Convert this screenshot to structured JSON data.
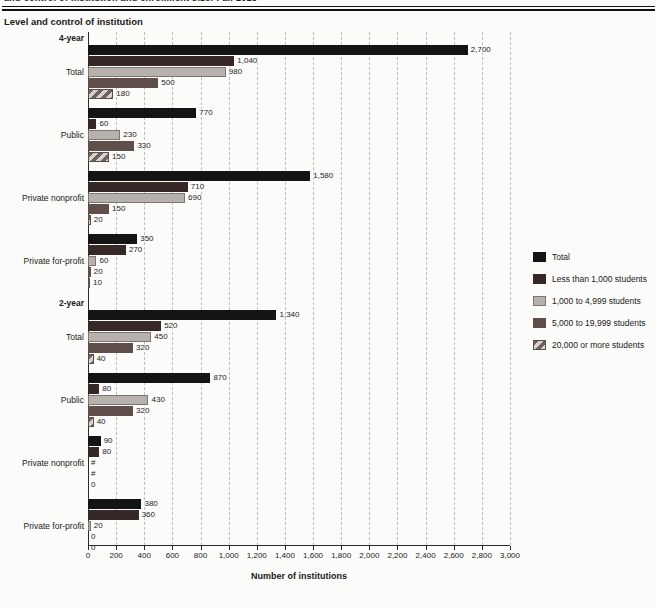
{
  "page": {
    "clipped_caption": "and control of institution and enrollment size: Fall 2015",
    "chart_header": "Level and control of institution"
  },
  "chart_data": {
    "type": "bar",
    "orientation": "horizontal",
    "xlabel": "Number of institutions",
    "xlim": [
      0,
      3000
    ],
    "grid": "vertical-dashed",
    "xticks": [
      0,
      200,
      400,
      600,
      800,
      1000,
      1200,
      1400,
      1600,
      1800,
      2000,
      2200,
      2400,
      2600,
      2800,
      3000
    ],
    "xtick_labels": [
      "0",
      "200",
      "400",
      "600",
      "800",
      "1,000",
      "1,200",
      "1,400",
      "1,600",
      "1,800",
      "2,000",
      "2,200",
      "2,400",
      "2,600",
      "2,800",
      "3,000"
    ],
    "series": [
      "Total",
      "Less than 1,000 students",
      "1,000 to 4,999 students",
      "5,000 to 19,999 students",
      "20,000 or more students"
    ],
    "series_colors": [
      "#141414",
      "#352826",
      "#b7b1ae",
      "#5f4e4a",
      "hatched-diagonal"
    ],
    "legend": {
      "position": "right",
      "entries": [
        "Total",
        "Less than 1,000 students",
        "1,000 to 4,999 students",
        "5,000 to 19,999 students",
        "20,000 or more students"
      ]
    },
    "sections": [
      {
        "label": "4-year",
        "groups": [
          {
            "label": "Total",
            "values": [
              2700,
              1040,
              980,
              500,
              180
            ],
            "value_labels": [
              "2,700",
              "1,040",
              "980",
              "500",
              "180"
            ]
          },
          {
            "label": "Public",
            "values": [
              770,
              60,
              230,
              330,
              150
            ],
            "value_labels": [
              "770",
              "60",
              "230",
              "330",
              "150"
            ]
          },
          {
            "label": "Private nonprofit",
            "values": [
              1580,
              710,
              690,
              150,
              20
            ],
            "value_labels": [
              "1,580",
              "710",
              "690",
              "150",
              "20"
            ]
          },
          {
            "label": "Private for-profit",
            "values": [
              350,
              270,
              60,
              20,
              10
            ],
            "value_labels": [
              "350",
              "270",
              "60",
              "20",
              "10"
            ]
          }
        ]
      },
      {
        "label": "2-year",
        "groups": [
          {
            "label": "Total",
            "values": [
              1340,
              520,
              450,
              320,
              40
            ],
            "value_labels": [
              "1,340",
              "520",
              "450",
              "320",
              "40"
            ]
          },
          {
            "label": "Public",
            "values": [
              870,
              80,
              430,
              320,
              40
            ],
            "value_labels": [
              "870",
              "80",
              "430",
              "320",
              "40"
            ]
          },
          {
            "label": "Private nonprofit",
            "values": [
              90,
              80,
              0,
              0,
              0
            ],
            "value_labels": [
              "90",
              "80",
              "#",
              "#",
              "0"
            ]
          },
          {
            "label": "Private for-profit",
            "values": [
              380,
              360,
              20,
              0,
              0
            ],
            "value_labels": [
              "380",
              "360",
              "20",
              "0",
              "0"
            ]
          }
        ]
      }
    ]
  }
}
